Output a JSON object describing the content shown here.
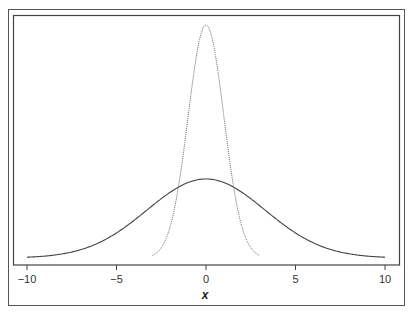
{
  "chart_data": {
    "type": "line",
    "title": "",
    "xlabel": "x",
    "ylabel": "",
    "xlim": [
      -10.5,
      11
    ],
    "xticks": [
      -10,
      -5,
      0,
      5,
      10
    ],
    "xtick_labels": [
      "−10",
      "−5",
      "0",
      "5",
      "10"
    ],
    "grid": false,
    "legend": null,
    "series": [
      {
        "name": "narrow density (dotted)",
        "style": "dotted",
        "color": "#555555",
        "distribution": "normal",
        "mean": 0,
        "sd": 1,
        "x_range": [
          -3,
          3
        ],
        "x": [
          -3,
          -2.5,
          -2,
          -1.5,
          -1,
          -0.5,
          0,
          0.5,
          1,
          1.5,
          2,
          2.5,
          3
        ],
        "y": [
          0.004,
          0.018,
          0.054,
          0.13,
          0.242,
          0.352,
          0.399,
          0.352,
          0.242,
          0.13,
          0.054,
          0.018,
          0.004
        ]
      },
      {
        "name": "wide density (solid)",
        "style": "solid",
        "color": "#444444",
        "distribution": "normal",
        "mean": 0,
        "sd": 3.3,
        "x_range": [
          -10,
          10
        ],
        "x": [
          -10,
          -8,
          -6,
          -4,
          -2,
          0,
          2,
          4,
          6,
          8,
          10
        ],
        "y": [
          0.0012,
          0.0064,
          0.0232,
          0.0577,
          0.1,
          0.1209,
          0.1,
          0.0577,
          0.0232,
          0.0064,
          0.0012
        ]
      }
    ]
  },
  "layout": {
    "x0_px": 206,
    "px_per_unit": 17.9,
    "baseline_px": 258,
    "narrow_peak_px": 233,
    "wide_peak_px": 79
  }
}
